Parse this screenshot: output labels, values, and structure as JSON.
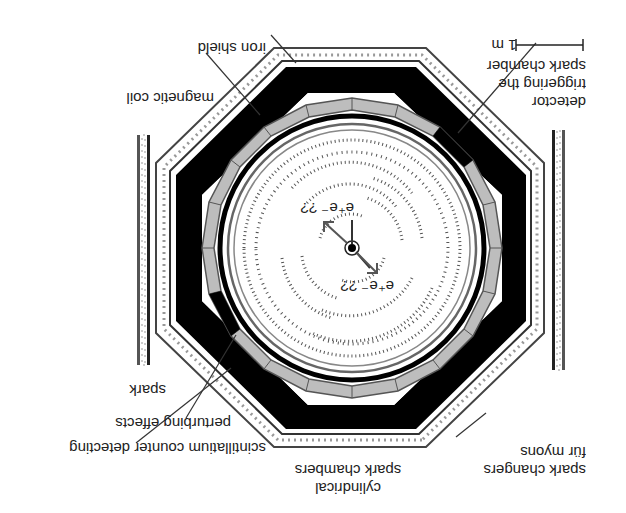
{
  "figure": {
    "orientation": "rotated 180 degrees",
    "title_fragment_visible": false
  },
  "labels": {
    "detector_line1": "detector",
    "detector_line2": "triggering the",
    "detector_line3": "spark chamber",
    "iron_shield": "iron shield",
    "magnetic_coil": "magnetic coil",
    "spark": "spark",
    "perturbing_effects": "perturbing effects",
    "scintillatium_counter": "scintillatium counter detecting",
    "cylindrical_line1": "cylindrical",
    "cylindrical_line2": "spark chambers",
    "spark_changers_line1": "spark changers",
    "spark_changers_line2": "für myons",
    "scale_bar": "1 m"
  },
  "annotations": {
    "eq_upper": "e⁺e⁻ ??",
    "eq_lower": "e⁺e⁻ ??"
  },
  "colors": {
    "black": "#000000",
    "grey_segment": "#bdbdbd",
    "dark_line": "#333333",
    "background": "#ffffff"
  }
}
